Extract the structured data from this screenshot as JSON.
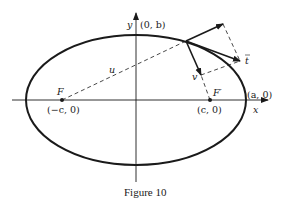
{
  "figure": {
    "caption": "Figure 10",
    "axes": {
      "x_label": "x",
      "y_label": "y"
    },
    "points": {
      "top_vertex": "(0, b)",
      "right_vertex": "(a, 0)",
      "left_focus_name": "F",
      "left_focus_coord": "(−c, 0)",
      "right_focus_name": "F′",
      "right_focus_coord": "(c, 0)"
    },
    "vectors": {
      "u_label": "u",
      "v_label": "v",
      "t_label": "t"
    },
    "colors": {
      "stroke": "#1a1a1a",
      "background": "#ffffff"
    }
  }
}
